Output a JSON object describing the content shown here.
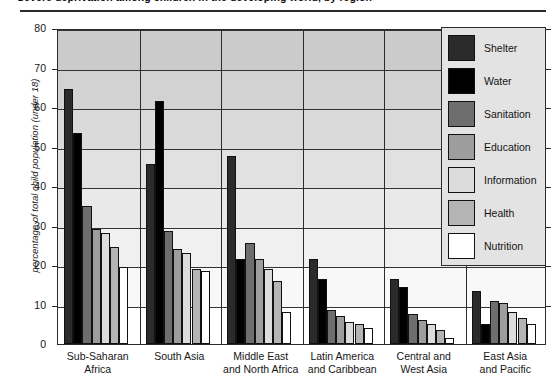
{
  "title": "Severe deprivation among children in the developing world, by region",
  "legend": {
    "position": "inside-top-right",
    "items": [
      {
        "label": "Shelter",
        "color": "#2b2b2b"
      },
      {
        "label": "Water",
        "color": "#000000"
      },
      {
        "label": "Sanitation",
        "color": "#6e6e6e"
      },
      {
        "label": "Education",
        "color": "#9d9d9d"
      },
      {
        "label": "Information",
        "color": "#dcdcdc"
      },
      {
        "label": "Health",
        "color": "#b4b4b4"
      },
      {
        "label": "Nutrition",
        "color": "#ffffff"
      }
    ]
  },
  "chart_data": {
    "type": "bar",
    "title": "Severe deprivation among children in the developing world, by region",
    "xlabel": "",
    "ylabel": "percentage of total child population (under 18)",
    "ylim": [
      0,
      80
    ],
    "yticks": [
      0,
      10,
      20,
      30,
      40,
      50,
      60,
      70,
      80
    ],
    "ytick_labels": [
      "0",
      "10",
      "20",
      "30",
      "40",
      "50",
      "60",
      "70",
      "80"
    ],
    "grid": true,
    "categories": [
      "Sub-Saharan\nAfrica",
      "South Asia",
      "Middle East\nand North Africa",
      "Latin America\nand Caribbean",
      "Central and\nWest Asia",
      "East Asia\nand Pacific"
    ],
    "category_lines": [
      [
        "Sub-Saharan",
        "Africa"
      ],
      [
        "South Asia",
        ""
      ],
      [
        "Middle East",
        "and North Africa"
      ],
      [
        "Latin America",
        "and Caribbean"
      ],
      [
        "Central and",
        "West Asia"
      ],
      [
        "East Asia",
        "and Pacific"
      ]
    ],
    "series": [
      {
        "name": "Shelter",
        "color": "#2b2b2b",
        "values": [
          64.5,
          45.5,
          47.5,
          21.5,
          16.5,
          13.5
        ]
      },
      {
        "name": "Water",
        "color": "#000000",
        "values": [
          53.5,
          61.5,
          21.5,
          16.5,
          14.5,
          5.0
        ]
      },
      {
        "name": "Sanitation",
        "color": "#6e6e6e",
        "values": [
          35.0,
          28.5,
          25.5,
          8.5,
          7.5,
          11.0
        ]
      },
      {
        "name": "Education",
        "color": "#9d9d9d",
        "values": [
          29.0,
          24.0,
          21.5,
          7.0,
          6.0,
          10.5
        ]
      },
      {
        "name": "Information",
        "color": "#dcdcdc",
        "values": [
          28.0,
          23.0,
          19.0,
          5.5,
          5.0,
          8.0
        ]
      },
      {
        "name": "Health",
        "color": "#b4b4b4",
        "values": [
          24.5,
          19.0,
          16.0,
          5.0,
          3.5,
          6.5
        ]
      },
      {
        "name": "Nutrition",
        "color": "#ffffff",
        "values": [
          19.5,
          18.5,
          8.0,
          4.0,
          1.5,
          5.0
        ]
      }
    ]
  }
}
